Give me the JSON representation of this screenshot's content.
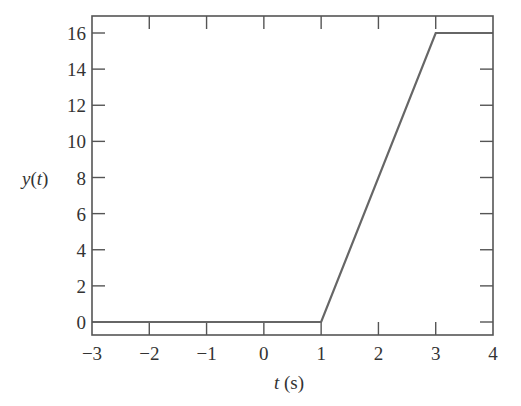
{
  "chart_data": {
    "type": "line",
    "title": "",
    "xlabel": "t (s)",
    "ylabel": "y(t)",
    "xlim": [
      -3,
      4
    ],
    "ylim": [
      -0.7,
      17
    ],
    "xticks": [
      -3,
      -2,
      -1,
      0,
      1,
      2,
      3,
      4
    ],
    "xtick_labels": [
      "−3",
      "−2",
      "−1",
      "0",
      "1",
      "2",
      "3",
      "4"
    ],
    "yticks": [
      0,
      2,
      4,
      6,
      8,
      10,
      12,
      14,
      16
    ],
    "ytick_labels": [
      "0",
      "2",
      "4",
      "6",
      "8",
      "10",
      "12",
      "14",
      "16"
    ],
    "grid": false,
    "legend": null,
    "series": [
      {
        "name": "y(t)",
        "x": [
          -3,
          1,
          3,
          4
        ],
        "y": [
          0,
          0,
          16,
          16
        ],
        "color": "#666666"
      }
    ]
  },
  "labels": {
    "xlabel_var": "t",
    "xlabel_unit": " (s)",
    "ylabel_var": "y",
    "ylabel_open": "(",
    "ylabel_arg": "t",
    "ylabel_close": ")"
  },
  "colors": {
    "frame": "#555555",
    "line": "#666666",
    "text": "#333333"
  }
}
